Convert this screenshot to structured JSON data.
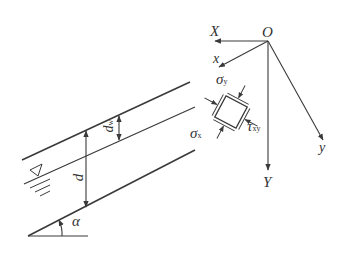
{
  "diagram": {
    "type": "slope-seepage-stress-element",
    "colors": {
      "line": "#3a3a3a",
      "background": "#ffffff",
      "text": "#333333"
    },
    "labels": {
      "origin": "O",
      "global_x": "X",
      "global_y": "Y",
      "local_x": "x",
      "local_y": "y",
      "sigma_y": "σ",
      "sigma_y_sub": "y",
      "sigma_x": "σ",
      "sigma_x_sub": "x",
      "tau": "τ",
      "tau_sub": "xy",
      "depth": "d",
      "depth_w": "d",
      "depth_w_sub": "w",
      "angle": "α",
      "water_table_symbol": "▽"
    },
    "lines": {
      "ground_surface": {
        "from": [
          22,
          160
        ],
        "to": [
          190,
          82
        ]
      },
      "water_table": {
        "from": [
          24,
          184
        ],
        "to": [
          195,
          107
        ]
      },
      "slip_surface": {
        "from": [
          28,
          236
        ],
        "to": [
          195,
          150
        ]
      },
      "angle_base": {
        "from": [
          28,
          236
        ],
        "to": [
          88,
          236
        ]
      }
    }
  }
}
